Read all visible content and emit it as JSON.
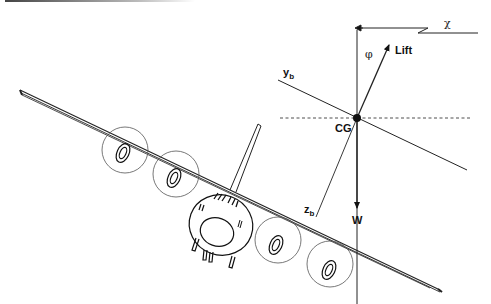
{
  "figure": {
    "type": "bank-angle force diagram"
  },
  "labels": {
    "heading": "χ",
    "bank_angle": "φ",
    "lift": "Lift",
    "weight": "W",
    "center_of_gravity": "CG",
    "y_axis": "y",
    "y_axis_sub": "b",
    "z_axis": "z",
    "z_axis_sub": "b"
  },
  "colors": {
    "line": "#111111",
    "background": "#ffffff"
  }
}
